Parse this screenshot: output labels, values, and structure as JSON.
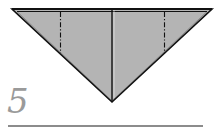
{
  "step": {
    "number": "5"
  },
  "diagram": {
    "shape": "inverted-triangle",
    "colors": {
      "paper_fill": "#b4b4b4",
      "outline": "#111111",
      "step_number": "#9a9a9a",
      "rule": "#8c8c8c"
    },
    "lines": [
      {
        "type": "edge",
        "label": "top-edge-double"
      },
      {
        "type": "crease",
        "label": "center-vertical-crease"
      },
      {
        "type": "dash-dot",
        "label": "left-fold-guide"
      },
      {
        "type": "dash-dot",
        "label": "right-fold-guide"
      }
    ]
  }
}
